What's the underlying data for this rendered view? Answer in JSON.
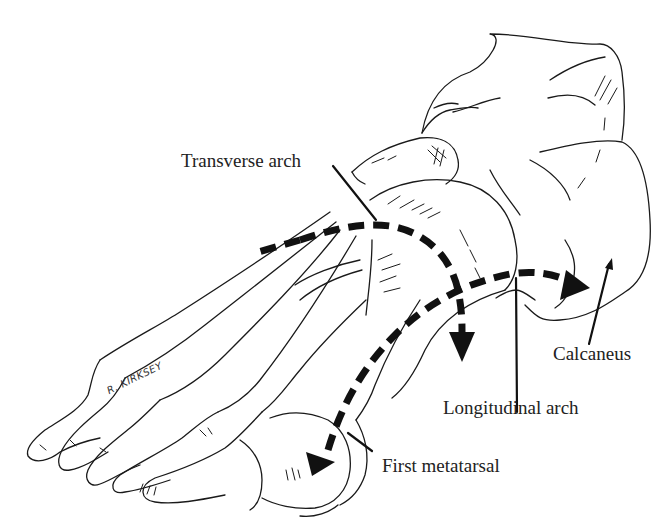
{
  "figure": {
    "style": "black ink line drawing",
    "colors": {
      "background": "#ffffff",
      "ink": "#111111",
      "text": "#222222"
    }
  },
  "labels": {
    "transverse_arch": "Transverse arch",
    "calcaneus": "Calcaneus",
    "longitudinal_arch": "Longitudinal arch",
    "first_metatarsal": "First metatarsal"
  },
  "signature": "R. KIRKSEY"
}
